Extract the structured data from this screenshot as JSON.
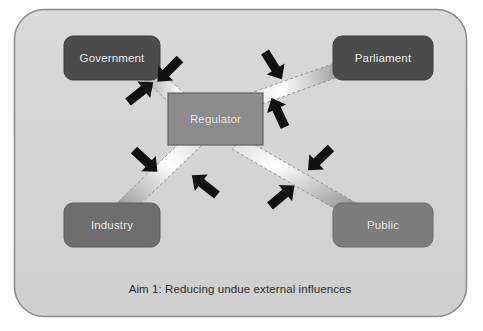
{
  "diagram": {
    "title": "Aim 1: Reducing undue external influences",
    "caption": "Aim 1: Reducing undue external influences",
    "container": {
      "name": "diagram-frame",
      "fill": "#d4d4d4",
      "border_color": "#8d8d8d",
      "corner_radius": 30
    },
    "center_node": {
      "id": "regulator",
      "label": "Regulator",
      "shape": "rectangle",
      "fill": "#8c8c8c",
      "border_color": "#636363",
      "text_color": "#f2f2f2"
    },
    "nodes": [
      {
        "id": "government",
        "label": "Government",
        "shape": "rounded-rectangle",
        "position": "top-left",
        "fill": "#4b4b4b",
        "text_color": "#f2f2f2"
      },
      {
        "id": "parliament",
        "label": "Parliament",
        "shape": "rounded-rectangle",
        "position": "top-right",
        "fill": "#4b4b4b",
        "text_color": "#f2f2f2"
      },
      {
        "id": "industry",
        "label": "Industry",
        "shape": "rounded-rectangle",
        "position": "bottom-left",
        "fill": "#6e6e6e",
        "text_color": "#f2f2f2"
      },
      {
        "id": "public",
        "label": "Public",
        "shape": "rounded-rectangle",
        "position": "bottom-right",
        "fill": "#7d7d7d",
        "text_color": "#f2f2f2"
      }
    ],
    "connectors": [
      {
        "id": "government-regulator",
        "from": "government",
        "to": "regulator",
        "style": "dashed-outline-gradient-band",
        "gradient_from": "#6d6d6d",
        "gradient_to": "#ffffff"
      },
      {
        "id": "parliament-regulator",
        "from": "parliament",
        "to": "regulator",
        "style": "dashed-outline-gradient-band",
        "gradient_from": "#6d6d6d",
        "gradient_to": "#ffffff"
      },
      {
        "id": "industry-regulator",
        "from": "industry",
        "to": "regulator",
        "style": "dashed-outline-gradient-band",
        "gradient_from": "#6d6d6d",
        "gradient_to": "#ffffff"
      },
      {
        "id": "public-regulator",
        "from": "public",
        "to": "regulator",
        "style": "dashed-outline-gradient-band",
        "gradient_from": "#6d6d6d",
        "gradient_to": "#ffffff"
      }
    ],
    "pressure_arrows": {
      "count": 8,
      "color": "#111111",
      "meaning": "inward pressure pinching each connector",
      "targets": [
        "government-regulator",
        "government-regulator",
        "parliament-regulator",
        "parliament-regulator",
        "industry-regulator",
        "industry-regulator",
        "public-regulator",
        "public-regulator"
      ]
    }
  }
}
